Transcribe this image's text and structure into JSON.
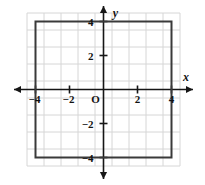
{
  "chart_data": {
    "type": "scatter",
    "title": "",
    "xlabel": "x",
    "ylabel": "y",
    "xlim": [
      -4.5,
      4.5
    ],
    "ylim": [
      -4.5,
      4.5
    ],
    "grid": true,
    "grid_step": 1,
    "legend": "none",
    "origin_label": "O",
    "x_ticks": [
      {
        "value": -4,
        "label": "−4"
      },
      {
        "value": -2,
        "label": "−2"
      },
      {
        "value": 2,
        "label": "2"
      },
      {
        "value": 4,
        "label": "4"
      }
    ],
    "y_ticks": [
      {
        "value": 4,
        "label": "4"
      },
      {
        "value": 2,
        "label": "2"
      },
      {
        "value": -2,
        "label": "−2"
      },
      {
        "value": -4,
        "label": "−4"
      }
    ],
    "shapes": [
      {
        "name": "square",
        "type": "polygon",
        "closed": true,
        "stroke": "#3a3a3a",
        "stroke_width": 2,
        "fill": "none",
        "vertices": [
          {
            "x": -4,
            "y": 4
          },
          {
            "x": 4,
            "y": 4
          },
          {
            "x": 4,
            "y": -4
          },
          {
            "x": -4,
            "y": -4
          }
        ]
      }
    ],
    "colors": {
      "grid": "#d6d6d6",
      "axis": "#161616",
      "shape": "#3a3a3a",
      "background": "#ffffff",
      "text": "#121212"
    }
  }
}
